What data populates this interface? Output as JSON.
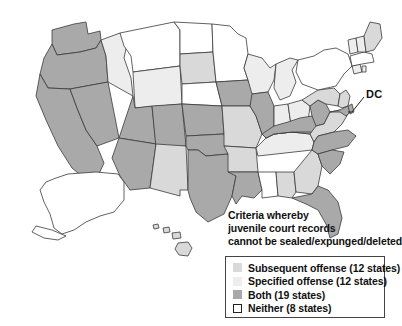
{
  "map": {
    "title_caption": {
      "line1": "Criteria whereby",
      "line2": "juvenile court records",
      "line3": "cannot be sealed/expunged/deleted"
    },
    "annotations": [
      {
        "name": "dc-callout",
        "label": "DC"
      }
    ],
    "colors": {
      "subsequent_offense": "#d9d9d9",
      "specified_offense": "#ededed",
      "both": "#a9a9a9",
      "neither": "#ffffff",
      "outline": "#3a3a3a",
      "text": "#111111",
      "legend_border": "#444444",
      "background": "#ffffff"
    },
    "legend": {
      "items": [
        {
          "label": "Subsequent offense (12 states)",
          "color": "#d9d9d9",
          "count": 12,
          "bordered": false
        },
        {
          "label": "Specified offense (12 states)",
          "color": "#ededed",
          "count": 12,
          "bordered": false
        },
        {
          "label": "Both (19 states)",
          "color": "#a9a9a9",
          "count": 19,
          "bordered": false
        },
        {
          "label": "Neither (8 states)",
          "color": "#ffffff",
          "count": 8,
          "bordered": true
        }
      ]
    },
    "states": [
      {
        "code": "WA",
        "category": "both"
      },
      {
        "code": "OR",
        "category": "both"
      },
      {
        "code": "CA",
        "category": "both"
      },
      {
        "code": "NV",
        "category": "both"
      },
      {
        "code": "ID",
        "category": "specified_offense"
      },
      {
        "code": "MT",
        "category": "neither"
      },
      {
        "code": "WY",
        "category": "specified_offense"
      },
      {
        "code": "UT",
        "category": "both"
      },
      {
        "code": "AZ",
        "category": "both"
      },
      {
        "code": "CO",
        "category": "both"
      },
      {
        "code": "NM",
        "category": "subsequent_offense"
      },
      {
        "code": "ND",
        "category": "neither"
      },
      {
        "code": "SD",
        "category": "subsequent_offense"
      },
      {
        "code": "NE",
        "category": "neither"
      },
      {
        "code": "KS",
        "category": "both"
      },
      {
        "code": "OK",
        "category": "both"
      },
      {
        "code": "TX",
        "category": "both"
      },
      {
        "code": "MN",
        "category": "neither"
      },
      {
        "code": "IA",
        "category": "both"
      },
      {
        "code": "MO",
        "category": "subsequent_offense"
      },
      {
        "code": "AR",
        "category": "subsequent_offense"
      },
      {
        "code": "LA",
        "category": "both"
      },
      {
        "code": "WI",
        "category": "specified_offense"
      },
      {
        "code": "IL",
        "category": "both"
      },
      {
        "code": "MS",
        "category": "neither"
      },
      {
        "code": "AL",
        "category": "subsequent_offense"
      },
      {
        "code": "MI",
        "category": "specified_offense"
      },
      {
        "code": "IN",
        "category": "specified_offense"
      },
      {
        "code": "KY",
        "category": "both"
      },
      {
        "code": "TN",
        "category": "specified_offense"
      },
      {
        "code": "GA",
        "category": "subsequent_offense"
      },
      {
        "code": "FL",
        "category": "both"
      },
      {
        "code": "OH",
        "category": "specified_offense"
      },
      {
        "code": "WV",
        "category": "both"
      },
      {
        "code": "VA",
        "category": "subsequent_offense"
      },
      {
        "code": "NC",
        "category": "both"
      },
      {
        "code": "SC",
        "category": "both"
      },
      {
        "code": "PA",
        "category": "subsequent_offense"
      },
      {
        "code": "NY",
        "category": "neither"
      },
      {
        "code": "NJ",
        "category": "subsequent_offense"
      },
      {
        "code": "DE",
        "category": "both"
      },
      {
        "code": "MD",
        "category": "both"
      },
      {
        "code": "DC",
        "category": "both"
      },
      {
        "code": "CT",
        "category": "specified_offense"
      },
      {
        "code": "RI",
        "category": "specified_offense"
      },
      {
        "code": "MA",
        "category": "neither"
      },
      {
        "code": "VT",
        "category": "specified_offense"
      },
      {
        "code": "NH",
        "category": "specified_offense"
      },
      {
        "code": "ME",
        "category": "subsequent_offense"
      },
      {
        "code": "AK",
        "category": "neither"
      },
      {
        "code": "HI",
        "category": "subsequent_offense"
      }
    ]
  }
}
